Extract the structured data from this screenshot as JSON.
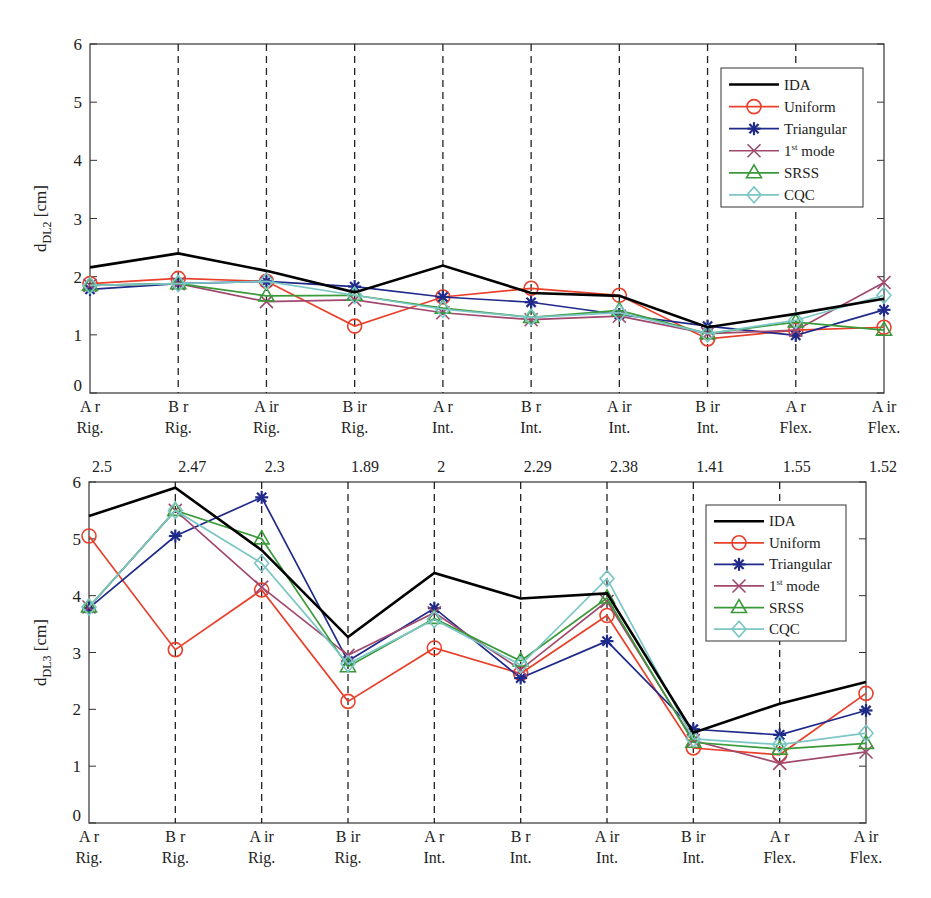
{
  "chart_data": [
    {
      "type": "line",
      "title": "",
      "xlabel": "",
      "ylabel": "d_DL2 [cm]",
      "ylabel_main": "d",
      "ylabel_sub": "DL2",
      "ylabel_unit": " [cm]",
      "ylim": [
        0,
        6
      ],
      "yticks": [
        0,
        1,
        2,
        3,
        4,
        5,
        6
      ],
      "grid": "vertical dashed lines at each category",
      "legend_position": "upper right",
      "categories": [
        "A r Rig.",
        "B r Rig.",
        "A ir Rig.",
        "B ir Rig.",
        "A r Int.",
        "B r Int.",
        "A ir Int.",
        "B ir Int.",
        "A r Flex.",
        "A ir Flex."
      ],
      "category_lines": [
        [
          "A r",
          "Rig."
        ],
        [
          "B r",
          "Rig."
        ],
        [
          "A ir",
          "Rig."
        ],
        [
          "B ir",
          "Rig."
        ],
        [
          "A r",
          "Int."
        ],
        [
          "B r",
          "Int."
        ],
        [
          "A ir",
          "Int."
        ],
        [
          "B ir",
          "Int."
        ],
        [
          "A r",
          "Flex."
        ],
        [
          "A ir",
          "Flex."
        ]
      ],
      "top_annotations": [],
      "series": [
        {
          "name": "IDA",
          "marker": "none",
          "color": "#000000",
          "values": [
            2.16,
            2.4,
            2.1,
            1.73,
            2.19,
            1.72,
            1.67,
            1.13,
            1.36,
            1.62
          ]
        },
        {
          "name": "Uniform",
          "marker": "circle",
          "color": "#e8402a",
          "values": [
            1.88,
            1.97,
            1.92,
            1.15,
            1.65,
            1.8,
            1.68,
            0.93,
            1.08,
            1.13
          ]
        },
        {
          "name": "Triangular",
          "marker": "asterisk",
          "color": "#1f2a8a",
          "values": [
            1.78,
            1.88,
            1.92,
            1.83,
            1.65,
            1.56,
            1.35,
            1.15,
            0.99,
            1.43
          ]
        },
        {
          "name": "1st mode",
          "marker": "x",
          "color": "#a0486e",
          "values": [
            1.85,
            1.88,
            1.57,
            1.6,
            1.38,
            1.26,
            1.32,
            1.02,
            1.08,
            1.9
          ]
        },
        {
          "name": "SRSS",
          "marker": "triangle",
          "color": "#3a9a3a",
          "values": [
            1.85,
            1.88,
            1.67,
            1.68,
            1.46,
            1.3,
            1.42,
            1.02,
            1.22,
            1.08
          ]
        },
        {
          "name": "CQC",
          "marker": "diamond",
          "color": "#7cc6c6",
          "values": [
            1.85,
            1.88,
            1.92,
            1.68,
            1.44,
            1.3,
            1.38,
            1.02,
            1.25,
            1.68
          ]
        }
      ]
    },
    {
      "type": "line",
      "title": "",
      "xlabel": "",
      "ylabel": "d_DL3 [cm]",
      "ylabel_main": "d",
      "ylabel_sub": "DL3",
      "ylabel_unit": " [cm]",
      "ylim": [
        0,
        6
      ],
      "yticks": [
        0,
        1,
        2,
        3,
        4,
        5,
        6
      ],
      "grid": "vertical dashed lines at each category",
      "legend_position": "upper right",
      "categories": [
        "A r Rig.",
        "B r Rig.",
        "A ir Rig.",
        "B ir Rig.",
        "A r Int.",
        "B r Int.",
        "A ir Int.",
        "B ir Int.",
        "A r Flex.",
        "A ir Flex."
      ],
      "category_lines": [
        [
          "A r",
          "Rig."
        ],
        [
          "B r",
          "Rig."
        ],
        [
          "A ir",
          "Rig."
        ],
        [
          "B ir",
          "Rig."
        ],
        [
          "A r",
          "Int."
        ],
        [
          "B r",
          "Int."
        ],
        [
          "A ir",
          "Int."
        ],
        [
          "B ir",
          "Int."
        ],
        [
          "A r",
          "Flex."
        ],
        [
          "A ir",
          "Flex."
        ]
      ],
      "top_annotations": [
        "2.5",
        "2.47",
        "2.3",
        "1.89",
        "2",
        "2.29",
        "2.38",
        "1.41",
        "1.55",
        "1.52"
      ],
      "series": [
        {
          "name": "IDA",
          "marker": "none",
          "color": "#000000",
          "values": [
            5.4,
            5.9,
            4.8,
            3.27,
            4.4,
            3.95,
            4.04,
            1.59,
            2.1,
            2.48
          ]
        },
        {
          "name": "Uniform",
          "marker": "circle",
          "color": "#e8402a",
          "values": [
            5.05,
            3.05,
            4.1,
            2.14,
            3.08,
            2.63,
            3.65,
            1.32,
            1.2,
            2.28
          ]
        },
        {
          "name": "Triangular",
          "marker": "asterisk",
          "color": "#1f2a8a",
          "values": [
            3.78,
            5.05,
            5.73,
            2.85,
            3.78,
            2.55,
            3.2,
            1.65,
            1.55,
            1.98
          ]
        },
        {
          "name": "1st mode",
          "marker": "x",
          "color": "#a0486e",
          "values": [
            3.8,
            5.5,
            4.15,
            2.95,
            3.7,
            2.7,
            3.9,
            1.45,
            1.05,
            1.25
          ]
        },
        {
          "name": "SRSS",
          "marker": "triangle",
          "color": "#3a9a3a",
          "values": [
            3.8,
            5.5,
            5.0,
            2.75,
            3.6,
            2.85,
            3.96,
            1.42,
            1.3,
            1.4
          ]
        },
        {
          "name": "CQC",
          "marker": "diamond",
          "color": "#7cc6c6",
          "values": [
            3.8,
            5.5,
            4.57,
            2.8,
            3.58,
            2.78,
            4.3,
            1.48,
            1.38,
            1.58
          ]
        }
      ]
    }
  ],
  "legend": {
    "items": [
      {
        "label": "IDA",
        "sup": ""
      },
      {
        "label": "Uniform",
        "sup": ""
      },
      {
        "label": "Triangular",
        "sup": ""
      },
      {
        "label": "1",
        "sup": "st",
        "suffix": " mode"
      },
      {
        "label": "SRSS",
        "sup": ""
      },
      {
        "label": "CQC",
        "sup": ""
      }
    ]
  }
}
